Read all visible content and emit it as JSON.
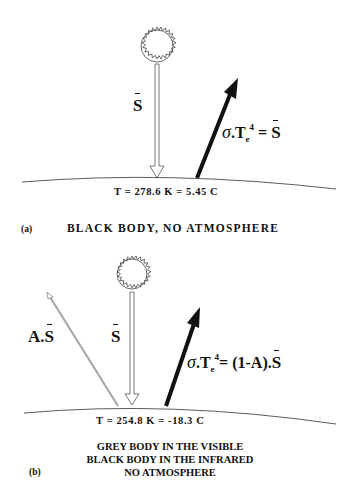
{
  "panel_a": {
    "tag": "(a)",
    "caption": "BLACK BODY, NO ATMOSPHERE",
    "temperature": "T = 278.6 K = 5.45 C",
    "incoming_label": "S",
    "formula": {
      "sigma": "σ",
      "dot": ".",
      "T": "T",
      "sub": "e",
      "sup": "4",
      "eq": " = ",
      "rhs": "S"
    }
  },
  "panel_b": {
    "tag": "(b)",
    "caption_lines": [
      "GREY BODY IN THE VISIBLE",
      "BLACK BODY IN THE INFRARED",
      "NO ATMOSPHERE"
    ],
    "temperature": "T = 254.8 K = -18.3 C",
    "incoming_label": "S",
    "reflected_label_prefix": "A.",
    "reflected_label_symbol": "S",
    "formula": {
      "sigma": "σ",
      "dot": ".",
      "T": "T",
      "sub": "e",
      "sup": "4",
      "eq": "= ",
      "rhs_prefix": "(1-A).",
      "rhs": "S"
    }
  },
  "colors": {
    "ink": "#111111",
    "reflected_arrow": "#a8a8a8",
    "incoming_arrow_outline": "#555555",
    "background": "#ffffff"
  }
}
